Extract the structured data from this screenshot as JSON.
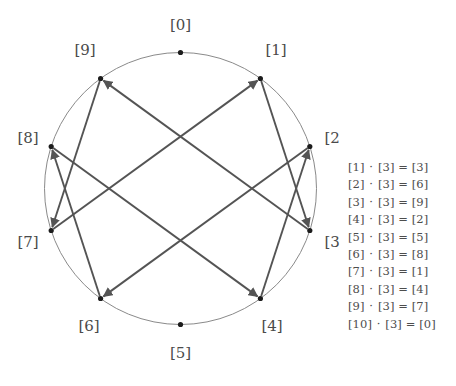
{
  "figure": {
    "modulus": 10,
    "multiplier": 3,
    "geometry": {
      "center_x": 180.5,
      "center_y": 188.5,
      "radius": 136,
      "label_radius": 163
    },
    "colors": {
      "circle_stroke": "#8a8a8a",
      "edge_stroke": "#545454",
      "vertex_fill": "#1c1c1c",
      "label_text": "#4a4a4a",
      "equation_text": "#4d4d4d",
      "background": "#ffffff"
    }
  },
  "vertices": [
    {
      "id": 0,
      "label": "[0]",
      "x": 180.5,
      "y": 52.5,
      "lx": 180.5,
      "ly": 25.5,
      "anchor": "middle"
    },
    {
      "id": 1,
      "label": "[1]",
      "x": 260.4,
      "y": 78.5,
      "lx": 276.0,
      "ly": 51.0,
      "anchor": "middle"
    },
    {
      "id": 2,
      "label": "[2]",
      "x": 309.8,
      "y": 146.5,
      "lx": 335.0,
      "ly": 139.0,
      "anchor": "middle"
    },
    {
      "id": 3,
      "label": "[3]",
      "x": 309.8,
      "y": 230.5,
      "lx": 335.0,
      "ly": 243.0,
      "anchor": "middle"
    },
    {
      "id": 4,
      "label": "[4]",
      "x": 260.4,
      "y": 298.5,
      "lx": 272.0,
      "ly": 327.0,
      "anchor": "middle"
    },
    {
      "id": 5,
      "label": "[5]",
      "x": 180.5,
      "y": 324.5,
      "lx": 180.5,
      "ly": 354.0,
      "anchor": "middle"
    },
    {
      "id": 6,
      "label": "[6]",
      "x": 100.6,
      "y": 298.5,
      "lx": 89.0,
      "ly": 327.0,
      "anchor": "middle"
    },
    {
      "id": 7,
      "label": "[7]",
      "x": 51.2,
      "y": 230.5,
      "lx": 28.0,
      "ly": 243.0,
      "anchor": "middle"
    },
    {
      "id": 8,
      "label": "[8]",
      "x": 51.2,
      "y": 146.5,
      "lx": 28.0,
      "ly": 139.0,
      "anchor": "middle"
    },
    {
      "id": 9,
      "label": "[9]",
      "x": 100.6,
      "y": 78.5,
      "lx": 85.0,
      "ly": 51.0,
      "anchor": "middle"
    }
  ],
  "edges": [
    {
      "from": 1,
      "to": 3
    },
    {
      "from": 2,
      "to": 6
    },
    {
      "from": 3,
      "to": 9
    },
    {
      "from": 4,
      "to": 2
    },
    {
      "from": 5,
      "to": 5
    },
    {
      "from": 6,
      "to": 8
    },
    {
      "from": 7,
      "to": 1
    },
    {
      "from": 8,
      "to": 4
    },
    {
      "from": 9,
      "to": 7
    },
    {
      "from": 10,
      "to": 0
    }
  ],
  "equations": [
    {
      "lhs": "[1]",
      "op": "·",
      "factor": "[3]",
      "eq": "=",
      "rhs": "[3]"
    },
    {
      "lhs": "[2]",
      "op": "·",
      "factor": "[3]",
      "eq": "=",
      "rhs": "[6]"
    },
    {
      "lhs": "[3]",
      "op": "·",
      "factor": "[3]",
      "eq": "=",
      "rhs": "[9]"
    },
    {
      "lhs": "[4]",
      "op": "·",
      "factor": "[3]",
      "eq": "=",
      "rhs": "[2]"
    },
    {
      "lhs": "[5]",
      "op": "·",
      "factor": "[3]",
      "eq": "=",
      "rhs": "[5]"
    },
    {
      "lhs": "[6]",
      "op": "·",
      "factor": "[3]",
      "eq": "=",
      "rhs": "[8]"
    },
    {
      "lhs": "[7]",
      "op": "·",
      "factor": "[3]",
      "eq": "=",
      "rhs": "[1]"
    },
    {
      "lhs": "[8]",
      "op": "·",
      "factor": "[3]",
      "eq": "=",
      "rhs": "[4]"
    },
    {
      "lhs": "[9]",
      "op": "·",
      "factor": "[3]",
      "eq": "=",
      "rhs": "[7]"
    },
    {
      "lhs": "[10]",
      "op": "·",
      "factor": "[3]",
      "eq": "=",
      "rhs": "[0]"
    }
  ],
  "chart_data": {
    "type": "diagram",
    "nodes": [
      "[0]",
      "[1]",
      "[2]",
      "[3]",
      "[4]",
      "[5]",
      "[6]",
      "[7]",
      "[8]",
      "[9]"
    ],
    "directed_edges": [
      [
        0,
        0
      ],
      [
        1,
        3
      ],
      [
        2,
        6
      ],
      [
        3,
        9
      ],
      [
        4,
        2
      ],
      [
        5,
        5
      ],
      [
        6,
        8
      ],
      [
        7,
        1
      ],
      [
        8,
        4
      ],
      [
        9,
        7
      ]
    ],
    "layout": "circular",
    "legend": "none"
  }
}
